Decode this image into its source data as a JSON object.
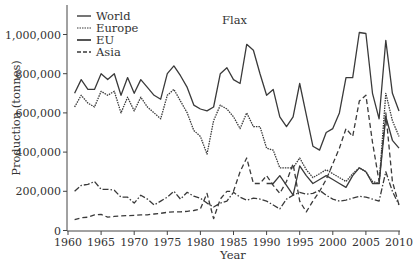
{
  "chart_data": {
    "type": "line",
    "title": "Flax",
    "xlabel": "Year",
    "ylabel": "Production (tonnes)",
    "xlim": [
      1960,
      2010
    ],
    "ylim": [
      0,
      1100000
    ],
    "grid": false,
    "legend_position": "top-left",
    "x_ticks": [
      1960,
      1965,
      1970,
      1975,
      1980,
      1985,
      1990,
      1995,
      2000,
      2005,
      2010
    ],
    "y_ticks": [
      0,
      200000,
      400000,
      600000,
      800000,
      1000000
    ],
    "y_tick_labels": [
      "0",
      "200,000",
      "400,000",
      "600,000",
      "800,000",
      "1,000,000"
    ],
    "x": [
      1961,
      1962,
      1963,
      1964,
      1965,
      1966,
      1967,
      1968,
      1969,
      1970,
      1971,
      1972,
      1973,
      1974,
      1975,
      1976,
      1977,
      1978,
      1979,
      1980,
      1981,
      1982,
      1983,
      1984,
      1985,
      1986,
      1987,
      1988,
      1989,
      1990,
      1991,
      1992,
      1993,
      1994,
      1995,
      1996,
      1997,
      1998,
      1999,
      2000,
      2001,
      2002,
      2003,
      2004,
      2005,
      2006,
      2007,
      2008,
      2009,
      2010
    ],
    "series": [
      {
        "name": "World",
        "style": "solid",
        "values": [
          700000,
          770000,
          720000,
          720000,
          800000,
          770000,
          800000,
          690000,
          780000,
          700000,
          770000,
          730000,
          690000,
          670000,
          800000,
          840000,
          790000,
          730000,
          640000,
          620000,
          610000,
          630000,
          800000,
          830000,
          770000,
          750000,
          950000,
          920000,
          800000,
          690000,
          720000,
          580000,
          530000,
          580000,
          750000,
          590000,
          430000,
          410000,
          500000,
          520000,
          600000,
          780000,
          780000,
          1010000,
          1005000,
          700000,
          570000,
          970000,
          700000,
          610000
        ]
      },
      {
        "name": "Europe",
        "style": "dotted",
        "values": [
          630000,
          690000,
          650000,
          630000,
          710000,
          690000,
          710000,
          600000,
          680000,
          610000,
          680000,
          630000,
          600000,
          570000,
          690000,
          720000,
          660000,
          600000,
          510000,
          480000,
          390000,
          560000,
          640000,
          620000,
          580000,
          520000,
          600000,
          530000,
          530000,
          420000,
          410000,
          320000,
          320000,
          320000,
          370000,
          310000,
          270000,
          290000,
          310000,
          290000,
          270000,
          250000,
          290000,
          320000,
          300000,
          250000,
          240000,
          700000,
          560000,
          480000
        ]
      },
      {
        "name": "EU",
        "style": "solid",
        "values": [
          null,
          null,
          null,
          null,
          null,
          null,
          null,
          null,
          null,
          null,
          null,
          null,
          null,
          null,
          null,
          null,
          null,
          null,
          null,
          null,
          null,
          null,
          null,
          null,
          null,
          null,
          null,
          null,
          null,
          240000,
          240000,
          280000,
          230000,
          180000,
          330000,
          280000,
          240000,
          260000,
          280000,
          260000,
          240000,
          220000,
          280000,
          320000,
          300000,
          240000,
          240000,
          580000,
          460000,
          420000
        ]
      },
      {
        "name": "Asia",
        "style": "dashed",
        "values": [
          55000,
          65000,
          68000,
          80000,
          82000,
          68000,
          72000,
          75000,
          76000,
          77000,
          80000,
          80000,
          84000,
          88000,
          93000,
          95000,
          95000,
          98000,
          102000,
          110000,
          190000,
          60000,
          160000,
          200000,
          200000,
          300000,
          370000,
          240000,
          240000,
          280000,
          230000,
          190000,
          250000,
          340000,
          150000,
          95000,
          150000,
          200000,
          260000,
          340000,
          420000,
          520000,
          480000,
          660000,
          690000,
          450000,
          250000,
          600000,
          250000,
          130000
        ]
      },
      {
        "name": "Asia-dashdot",
        "style": "dash-dot",
        "values": [
          200000,
          230000,
          235000,
          250000,
          210000,
          210000,
          205000,
          170000,
          170000,
          140000,
          180000,
          160000,
          130000,
          150000,
          170000,
          200000,
          160000,
          195000,
          175000,
          165000,
          140000,
          120000,
          140000,
          150000,
          195000,
          170000,
          155000,
          165000,
          160000,
          150000,
          130000,
          110000,
          160000,
          180000,
          195000,
          185000,
          190000,
          205000,
          180000,
          160000,
          150000,
          155000,
          165000,
          175000,
          170000,
          160000,
          150000,
          300000,
          200000,
          130000
        ]
      }
    ]
  },
  "legend": {
    "items": [
      {
        "label": "World",
        "style": "solid"
      },
      {
        "label": "Europe",
        "style": "dotted"
      },
      {
        "label": "EU",
        "style": "solid-thick"
      },
      {
        "label": "Asia",
        "style": "dashed"
      }
    ]
  }
}
